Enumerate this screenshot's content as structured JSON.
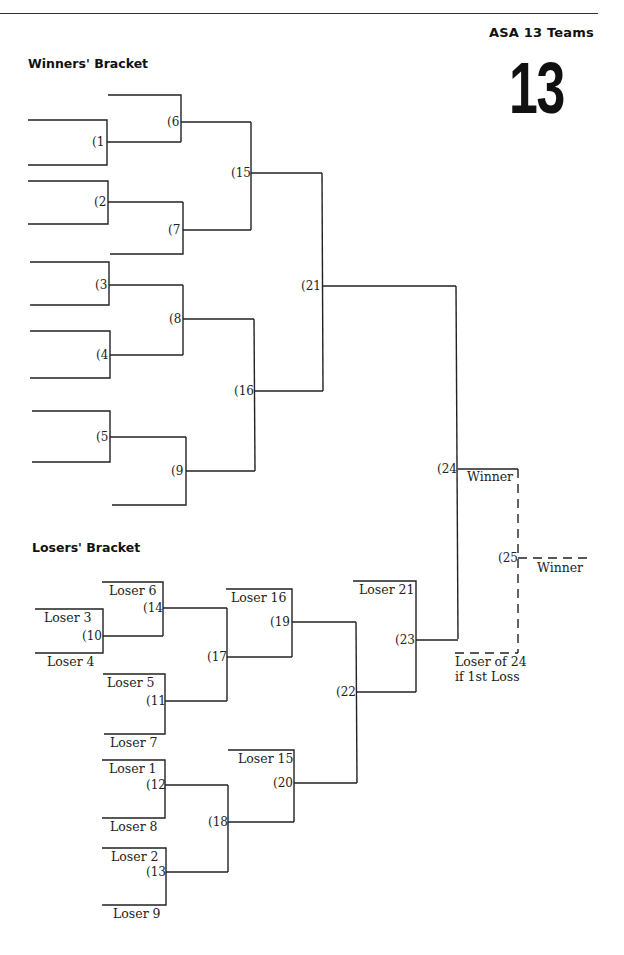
{
  "header": {
    "title": "ASA 13 Teams",
    "big_number": "13"
  },
  "winners_bracket": {
    "title": "Winners' Bracket",
    "games": [
      {
        "id": "g1",
        "label": "(1"
      },
      {
        "id": "g2",
        "label": "(2"
      },
      {
        "id": "g3",
        "label": "(3"
      },
      {
        "id": "g4",
        "label": "(4"
      },
      {
        "id": "g5",
        "label": "(5"
      },
      {
        "id": "g6",
        "label": "(6"
      },
      {
        "id": "g7",
        "label": "(7"
      },
      {
        "id": "g8",
        "label": "(8"
      },
      {
        "id": "g9",
        "label": "(9"
      },
      {
        "id": "g15",
        "label": "(15"
      },
      {
        "id": "g16",
        "label": "(16"
      },
      {
        "id": "g21",
        "label": "(21"
      }
    ]
  },
  "finals": {
    "games": [
      {
        "id": "g24",
        "label": "(24"
      },
      {
        "id": "g25",
        "label": "(25"
      }
    ],
    "winner_24_label": "Winner",
    "winner_25_label": "Winner",
    "loser_24_line1": "Loser of 24",
    "loser_24_line2": "if 1st Loss"
  },
  "losers_bracket": {
    "title": "Losers' Bracket",
    "games": [
      {
        "id": "g10",
        "label": "(10"
      },
      {
        "id": "g11",
        "label": "(11"
      },
      {
        "id": "g12",
        "label": "(12"
      },
      {
        "id": "g13",
        "label": "(13"
      },
      {
        "id": "g14",
        "label": "(14"
      },
      {
        "id": "g17",
        "label": "(17"
      },
      {
        "id": "g18",
        "label": "(18"
      },
      {
        "id": "g19",
        "label": "(19"
      },
      {
        "id": "g20",
        "label": "(20"
      },
      {
        "id": "g22",
        "label": "(22"
      },
      {
        "id": "g23",
        "label": "(23"
      }
    ],
    "slots": {
      "loser_3": "Loser 3",
      "loser_4": "Loser 4",
      "loser_6": "Loser 6",
      "loser_5": "Loser 5",
      "loser_7": "Loser 7",
      "loser_1": "Loser 1",
      "loser_8": "Loser 8",
      "loser_2": "Loser 2",
      "loser_9": "Loser 9",
      "loser_16": "Loser 16",
      "loser_15": "Loser 15",
      "loser_21": "Loser 21"
    }
  },
  "colors": {
    "line": "#222222",
    "background": "#ffffff"
  }
}
